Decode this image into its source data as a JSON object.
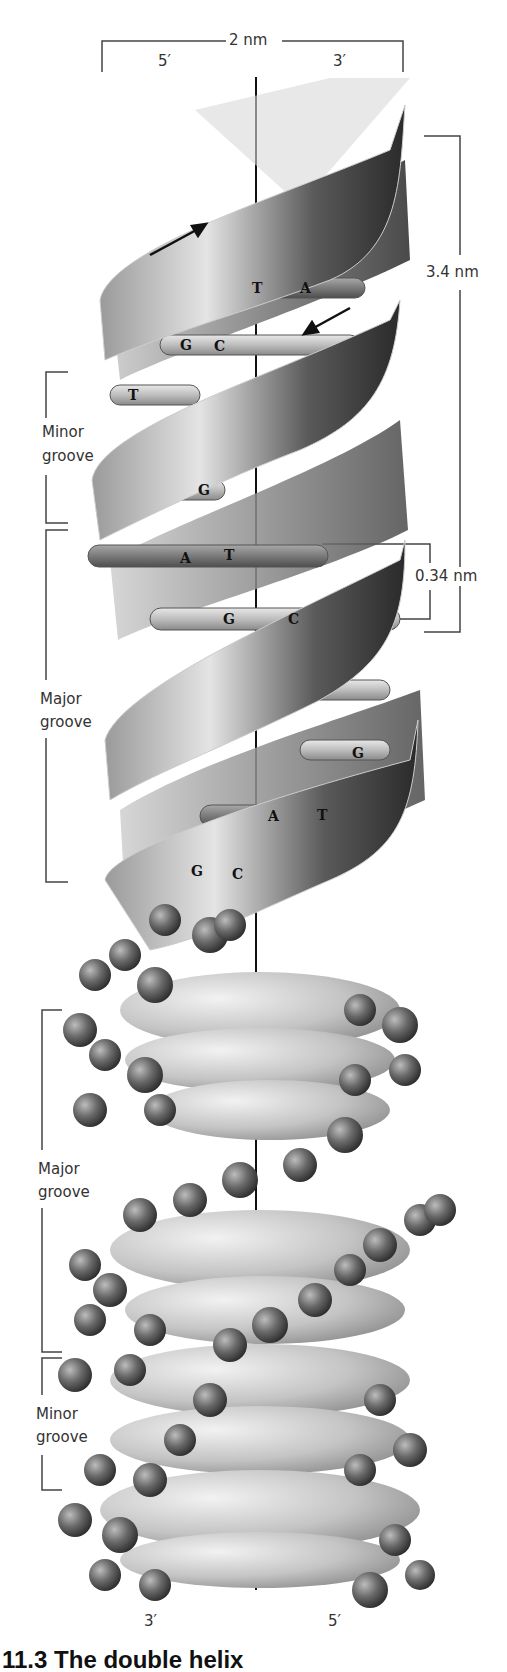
{
  "diagram": {
    "top": {
      "width_label": "2 nm",
      "left_end": "5′",
      "right_end": "3′"
    },
    "bottom": {
      "left_end": "3′",
      "right_end": "5′"
    },
    "dimensions": {
      "turn_length": "3.4 nm",
      "base_spacing": "0.34 nm"
    },
    "ribbon_model": {
      "grooves": [
        {
          "line1": "Minor",
          "line2": "groove"
        },
        {
          "line1": "Major",
          "line2": "groove"
        }
      ],
      "base_pairs": [
        {
          "left": "T",
          "right": "A"
        },
        {
          "left": "G",
          "right": "C"
        },
        {
          "left": "T",
          "right": ""
        },
        {
          "left": "G",
          "right": ""
        },
        {
          "left": "A",
          "right": "T"
        },
        {
          "left": "G",
          "right": "C"
        },
        {
          "left": "",
          "right": "G"
        },
        {
          "left": "A",
          "right": "T"
        },
        {
          "left": "G",
          "right": "C"
        }
      ],
      "strand_arrows": [
        "up-right",
        "down-left"
      ]
    },
    "space_filling_model": {
      "grooves": [
        {
          "line1": "Major",
          "line2": "groove"
        },
        {
          "line1": "Minor",
          "line2": "groove"
        }
      ]
    },
    "caption": "11.3 The double helix"
  },
  "colors": {
    "ribbon_dark": "#2e2e2e",
    "ribbon_mid": "#8a8a8a",
    "ribbon_light": "#e6e6e6",
    "base_rod": "#bdbdbd",
    "atom_dark": "#4a4a4a",
    "atom_light": "#c8c8c8",
    "label_text": "#333333"
  }
}
